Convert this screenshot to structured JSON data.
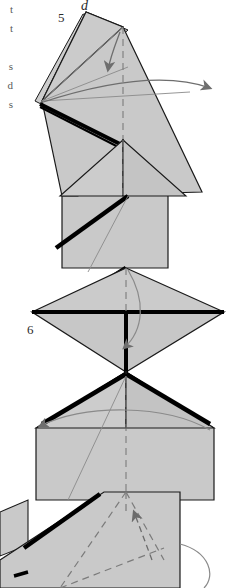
{
  "page": {
    "width": 230,
    "height": 588,
    "background": "#ffffff",
    "kind": "origami-instruction-diagram-scan"
  },
  "colors": {
    "paper_fill": "#c9c9c9",
    "paper_fill_light": "#d2d2d2",
    "paper_fill_dark": "#bebebe",
    "outline": "#1a1a1a",
    "thick_edge": "#000000",
    "crease_thin": "#8a8a8a",
    "arrow": "#6e6e6e",
    "dashed_fold": "#7b7b7b",
    "text": "#2b2b2b",
    "text_cropped": "#5a5a5a"
  },
  "cropped_text_column": {
    "name": "clipped-body-text",
    "lines": [
      "t",
      "t",
      "s",
      "d",
      "s"
    ]
  },
  "figures": [
    {
      "id": "figure-5",
      "step_number": "5",
      "point_label": "d",
      "description": "Folded paper seen from an angled view with a layered flap at left; a curved arrow sweeps from the apex to the right, and a second arrow points down into the body.",
      "arrows": [
        {
          "name": "sweep-right-arrow",
          "direction": "right-down"
        },
        {
          "name": "fold-down-arrow",
          "direction": "down"
        }
      ],
      "dashed_lines": [
        "vertical-center-axis"
      ]
    },
    {
      "id": "figure-6",
      "step_number": "6",
      "description": "Symmetric diamond (waterbomb-like) form with a heavy horizontal centre edge and a heavy vertical edge below it; a curved arrow hooks down through the centre.",
      "arrows": [
        {
          "name": "center-hook-arrow",
          "direction": "down"
        },
        {
          "name": "wide-arc-arrow",
          "direction": "left"
        }
      ],
      "dashed_lines": [
        "vertical-center-axis"
      ]
    },
    {
      "id": "figure-partial-bottom",
      "step_number": "",
      "description": "Partially cropped figure at the bottom of the page showing dashed valley-fold guide lines and an arrowhead pointing up-left, with a curve running off the right edge.",
      "arrows": [
        {
          "name": "inside-reverse-fold-arrow",
          "direction": "up-left"
        }
      ],
      "dashed_lines": [
        "fold-guide-left",
        "fold-guide-right",
        "vertical-center-axis"
      ]
    }
  ]
}
